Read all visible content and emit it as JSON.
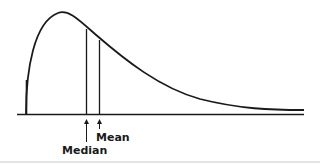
{
  "diagram": {
    "type": "right-skewed distribution curve",
    "colors": {
      "line": "#1a1a1a",
      "background": "#ffffff"
    },
    "markers": [
      {
        "label": "Median",
        "x": 86
      },
      {
        "label": "Mean",
        "x": 99
      }
    ]
  }
}
